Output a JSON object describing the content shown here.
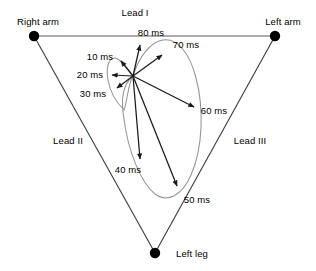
{
  "figure": {
    "type": "vector-diagram",
    "colors": {
      "line": "#3a3a3a",
      "loop": "#8f8f8f",
      "vector": "#1a1a1a",
      "electrode": "#000000",
      "text": "#000000",
      "background": "#ffffff"
    }
  },
  "electrodes": [
    {
      "id": "right-arm",
      "label": "Right arm",
      "x": 34,
      "y": 36,
      "label_x": 38,
      "label_y": 22
    },
    {
      "id": "left-arm",
      "label": "Left arm",
      "x": 275,
      "y": 36,
      "label_x": 283,
      "label_y": 22
    },
    {
      "id": "left-leg",
      "label": "Left leg",
      "x": 155,
      "y": 253,
      "label_x": 192,
      "label_y": 254
    }
  ],
  "leads": [
    {
      "id": "lead-i",
      "label": "Lead I",
      "label_x": 135,
      "label_y": 13
    },
    {
      "id": "lead-ii",
      "label": "Lead II",
      "label_x": 68,
      "label_y": 141
    },
    {
      "id": "lead-iii",
      "label": "Lead III",
      "label_x": 250,
      "label_y": 141
    }
  ],
  "origin": {
    "x": 133,
    "y": 76
  },
  "vectors": [
    {
      "id": "v10",
      "label": "10 ms",
      "tip_x": 120,
      "tip_y": 60,
      "label_x": 100,
      "label_y": 57
    },
    {
      "id": "v20",
      "label": "20 ms",
      "tip_x": 110,
      "tip_y": 75,
      "label_x": 90,
      "label_y": 75
    },
    {
      "id": "v30",
      "label": "30 ms",
      "tip_x": 116,
      "tip_y": 89,
      "label_x": 93,
      "label_y": 94
    },
    {
      "id": "v40",
      "label": "40 ms",
      "tip_x": 140,
      "tip_y": 161,
      "label_x": 128,
      "label_y": 170
    },
    {
      "id": "v50",
      "label": "50 ms",
      "tip_x": 178,
      "tip_y": 188,
      "label_x": 197,
      "label_y": 200
    },
    {
      "id": "v60",
      "label": "60 ms",
      "tip_x": 196,
      "tip_y": 109,
      "label_x": 214,
      "label_y": 111
    },
    {
      "id": "v70",
      "label": "70 ms",
      "tip_x": 163,
      "tip_y": 53,
      "label_x": 186,
      "label_y": 45
    },
    {
      "id": "v80",
      "label": "80 ms",
      "tip_x": 140,
      "tip_y": 42,
      "label_x": 151,
      "label_y": 33
    }
  ],
  "loops": [
    {
      "id": "qrs-loop",
      "description": "large QRS vector loop"
    },
    {
      "id": "initial-loop",
      "description": "small initial 10-30 ms loop"
    }
  ]
}
